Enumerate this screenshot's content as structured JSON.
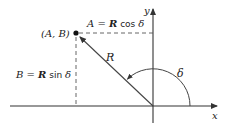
{
  "diagram": {
    "colors": {
      "ink": "#222222",
      "axis": "#333333",
      "dashed": "#555555",
      "background": "#ffffff"
    },
    "axes": {
      "x_label": "x",
      "y_label": "y"
    },
    "point": {
      "label": "(A, B)"
    },
    "vector": {
      "label": "R"
    },
    "angle": {
      "label": "δ"
    },
    "equations": {
      "horizontal": {
        "lhs": "A",
        "eq": " = ",
        "r": "R",
        "fn": " cos ",
        "angle": "δ"
      },
      "vertical": {
        "lhs": "B",
        "eq": " = ",
        "r": "R",
        "fn": " sin ",
        "angle": "δ"
      }
    }
  }
}
